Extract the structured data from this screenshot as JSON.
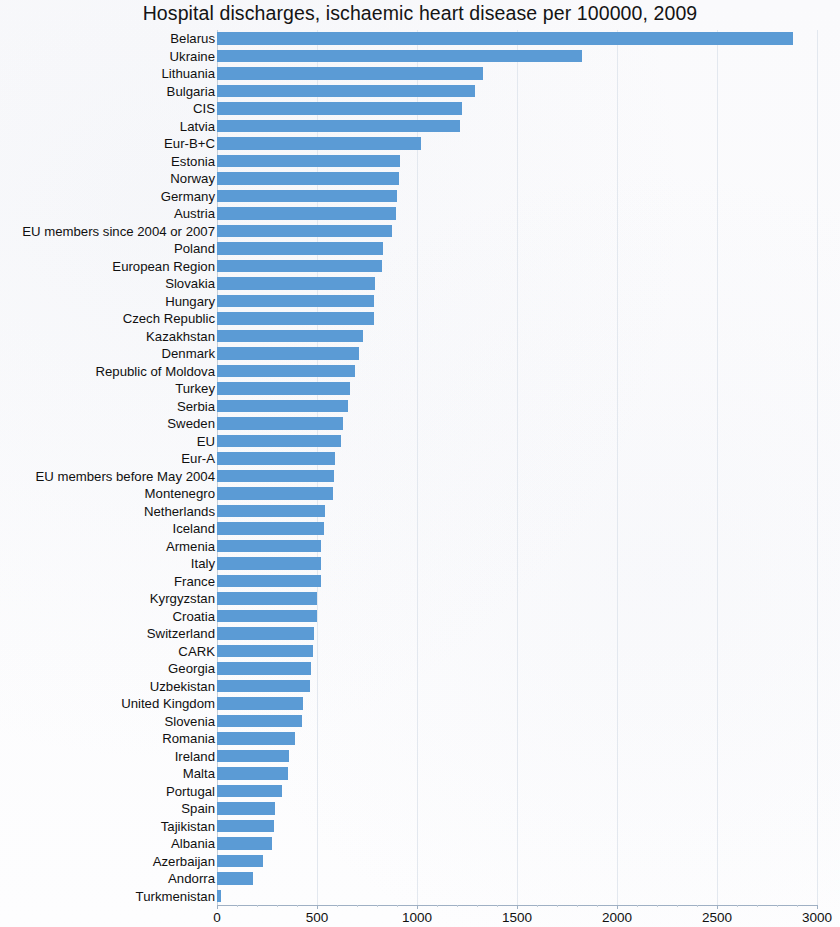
{
  "chart_data": {
    "type": "bar",
    "orientation": "horizontal",
    "title": "Hospital discharges, ischaemic heart disease per 100000, 2009",
    "xlabel": "",
    "ylabel": "",
    "xlim": [
      0,
      3000
    ],
    "xticks": [
      0,
      500,
      1000,
      1500,
      2000,
      2500,
      3000
    ],
    "xtick_labels": [
      "0",
      "500",
      "1000",
      "1500",
      "2000",
      "2500",
      "3000"
    ],
    "grid": true,
    "legend": null,
    "bar_color": "#5b9bd5",
    "categories": [
      "Belarus",
      "Ukraine",
      "Lithuania",
      "Bulgaria",
      "CIS",
      "Latvia",
      "Eur-B+C",
      "Estonia",
      "Norway",
      "Germany",
      "Austria",
      "EU members since 2004 or 2007",
      "Poland",
      "European Region",
      "Slovakia",
      "Hungary",
      "Czech Republic",
      "Kazakhstan",
      "Denmark",
      "Republic of Moldova",
      "Turkey",
      "Serbia",
      "Sweden",
      "EU",
      "Eur-A",
      "EU members before May 2004",
      "Montenegro",
      "Netherlands",
      "Iceland",
      "Armenia",
      "Italy",
      "France",
      "Kyrgyzstan",
      "Croatia",
      "Switzerland",
      "CARK",
      "Georgia",
      "Uzbekistan",
      "United Kingdom",
      "Slovenia",
      "Romania",
      "Ireland",
      "Malta",
      "Portugal",
      "Spain",
      "Tajikistan",
      "Albania",
      "Azerbaijan",
      "Andorra",
      "Turkmenistan"
    ],
    "values": [
      2880,
      1825,
      1330,
      1290,
      1225,
      1215,
      1020,
      915,
      910,
      900,
      895,
      875,
      830,
      825,
      790,
      785,
      785,
      730,
      710,
      690,
      665,
      655,
      630,
      620,
      590,
      585,
      580,
      540,
      535,
      520,
      520,
      520,
      500,
      500,
      485,
      480,
      470,
      465,
      430,
      425,
      390,
      360,
      355,
      325,
      290,
      285,
      275,
      230,
      180,
      20
    ]
  }
}
